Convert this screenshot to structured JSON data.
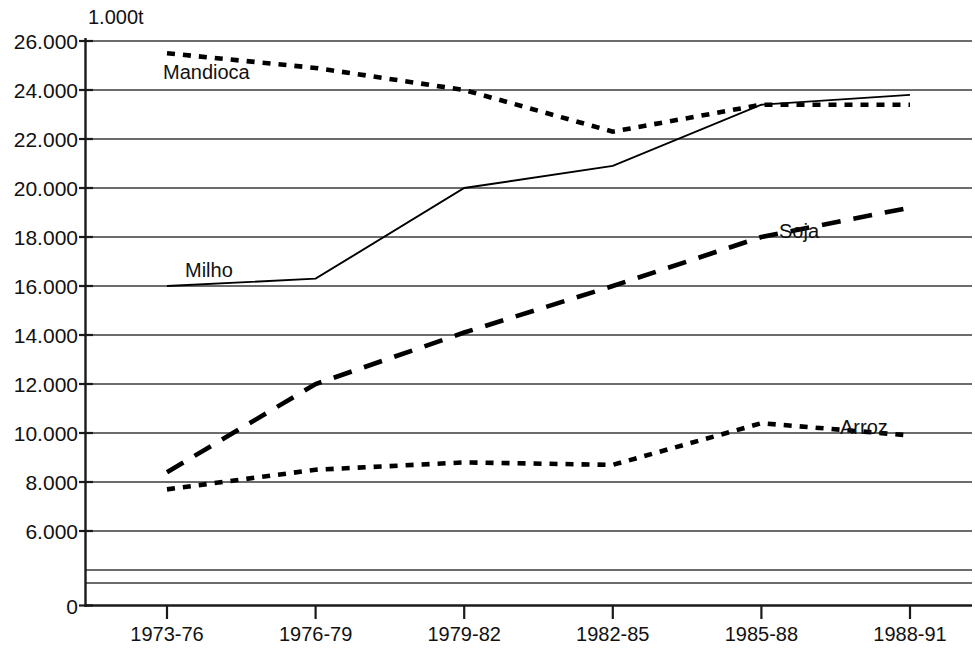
{
  "chart_data": {
    "type": "line",
    "title": "",
    "subtitle": "",
    "unit_label": "1.000t",
    "xlabel": "",
    "ylabel": "",
    "categories": [
      "1973-76",
      "1976-79",
      "1979-82",
      "1982-85",
      "1985-88",
      "1988-91"
    ],
    "ylim": [
      0,
      26000
    ],
    "y_ticks": [
      0,
      6000,
      8000,
      10000,
      12000,
      14000,
      16000,
      18000,
      20000,
      22000,
      24000,
      26000
    ],
    "y_tick_labels": [
      "0",
      "6.000",
      "8.000",
      "10.000",
      "12.000",
      "14.000",
      "16.000",
      "18.000",
      "20.000",
      "22.000",
      "24.000",
      "26.000"
    ],
    "extra_gridlines": [
      "unlabeled-gridline-upper",
      "unlabeled-gridline-lower"
    ],
    "grid": true,
    "legend_position": "inline-labels",
    "series": [
      {
        "name": "Mandioca",
        "style": "dotted",
        "values": [
          25500,
          24900,
          24000,
          22300,
          23400,
          23400
        ]
      },
      {
        "name": "Milho",
        "style": "solid",
        "values": [
          16000,
          16300,
          20000,
          20900,
          23400,
          23800
        ]
      },
      {
        "name": "Soja",
        "style": "dashed",
        "values": [
          8400,
          12000,
          14100,
          16000,
          18000,
          19200
        ]
      },
      {
        "name": "Arroz",
        "style": "dotted",
        "values": [
          7700,
          8500,
          8800,
          8700,
          10400,
          9900
        ]
      }
    ],
    "colors": {
      "series": "#000000",
      "grid": "#3b3b3b",
      "axis": "#1a1a1a",
      "background": "#ffffff",
      "text": "#111111"
    }
  }
}
